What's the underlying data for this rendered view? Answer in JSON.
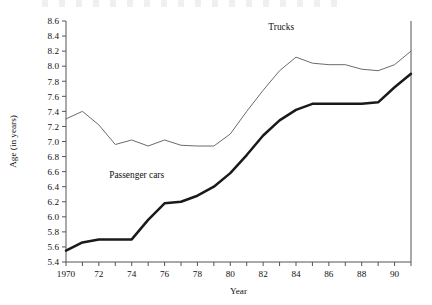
{
  "chart_data": {
    "type": "line",
    "title": "",
    "xlabel": "Year",
    "ylabel": "Age (in years)",
    "xlim": [
      1970,
      1991
    ],
    "ylim": [
      5.4,
      8.6
    ],
    "ytick_step": 0.2,
    "xtick_step": 1,
    "grid": false,
    "legend": "inline-labels",
    "x": [
      1970,
      1971,
      1972,
      1973,
      1974,
      1975,
      1976,
      1977,
      1978,
      1979,
      1980,
      1981,
      1982,
      1983,
      1984,
      1985,
      1986,
      1987,
      1988,
      1989,
      1990,
      1991
    ],
    "xtick_labels": [
      "1970",
      "",
      "72",
      "",
      "74",
      "",
      "76",
      "",
      "78",
      "",
      "80",
      "",
      "82",
      "",
      "84",
      "",
      "86",
      "",
      "88",
      "",
      "90",
      ""
    ],
    "ytick_labels": [
      "5.4",
      "5.6",
      "5.8",
      "6.0",
      "6.2",
      "6.4",
      "6.6",
      "6.8",
      "7.0",
      "7.2",
      "7.4",
      "7.6",
      "7.8",
      "8.0",
      "8.2",
      "8.4",
      "8.6"
    ],
    "series": [
      {
        "name": "Trucks",
        "color": "#6b6b6b",
        "label_x": 1983.1,
        "label_y": 8.48,
        "values": [
          7.3,
          7.4,
          7.22,
          6.96,
          7.02,
          6.94,
          7.02,
          6.95,
          6.94,
          6.94,
          7.1,
          7.4,
          7.68,
          7.94,
          8.12,
          8.04,
          8.02,
          8.02,
          7.96,
          7.94,
          8.02,
          8.2
        ]
      },
      {
        "name": "Passenger cars",
        "color": "#1a1a1a",
        "label_x": 1974.3,
        "label_y": 6.52,
        "values": [
          5.55,
          5.66,
          5.7,
          5.7,
          5.7,
          5.96,
          6.18,
          6.2,
          6.28,
          6.4,
          6.58,
          6.82,
          7.08,
          7.28,
          7.42,
          7.5,
          7.5,
          7.5,
          7.5,
          7.52,
          7.72,
          7.9
        ]
      }
    ]
  },
  "axis": {
    "x_title": "Year",
    "y_title": "Age (in years)"
  }
}
